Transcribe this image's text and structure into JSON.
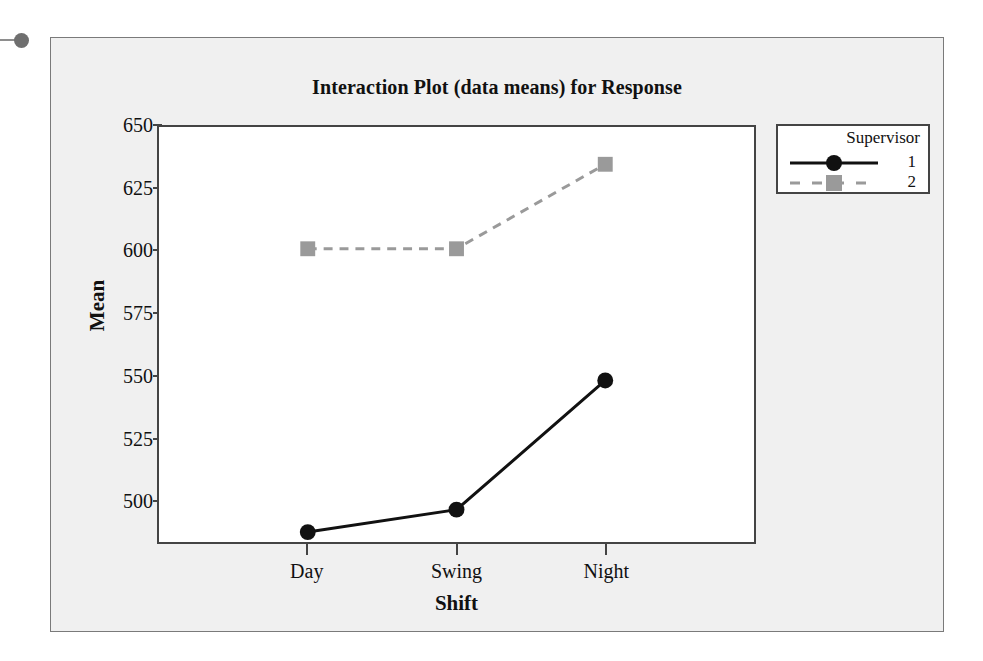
{
  "chart_data": {
    "type": "line",
    "title": "Interaction Plot (data means) for Response",
    "xlabel": "Shift",
    "ylabel": "Mean",
    "categories": [
      "Day",
      "Swing",
      "Night"
    ],
    "series": [
      {
        "name": "1",
        "values": [
          487,
          496,
          548
        ],
        "color": "#111111",
        "line_style": "solid",
        "marker": "circle"
      },
      {
        "name": "2",
        "values": [
          601,
          601,
          635
        ],
        "color": "#9a9a9a",
        "line_style": "dashed",
        "marker": "square"
      }
    ],
    "legend_title": "Supervisor",
    "legend_position": "right",
    "ylim": [
      483,
      650
    ],
    "yticks": [
      650,
      625,
      600,
      575,
      550,
      525,
      500
    ],
    "ytick_labels": [
      "650",
      "625",
      "600",
      "575",
      "550",
      "525",
      "500"
    ],
    "grid": false
  },
  "figure": {
    "background_color": "#f0f0f0",
    "plot_background_color": "#ffffff",
    "axis_color": "#444444"
  }
}
